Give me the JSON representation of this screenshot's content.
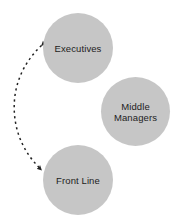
{
  "diagram": {
    "background_color": "#ffffff",
    "node_fill_color": "#c6c6c6",
    "text_color": "#1d1d1d",
    "connector_color": "#222222",
    "nodes": [
      {
        "id": "executives",
        "label": "Executives",
        "shape": "circle",
        "fill": "#c6c6c6"
      },
      {
        "id": "middle-managers",
        "label": "Middle\nManagers",
        "shape": "circle",
        "fill": "#c6c6c6"
      },
      {
        "id": "front-line",
        "label": "Front Line",
        "shape": "circle",
        "fill": "#c6c6c6"
      }
    ],
    "connectors": [
      {
        "id": "executives-front-line",
        "from": "executives",
        "to": "front-line",
        "style": "dashed",
        "arrowheads": "both",
        "curve": "bowed-left",
        "color": "#222222"
      }
    ]
  }
}
